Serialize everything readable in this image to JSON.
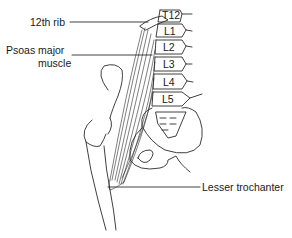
{
  "diagram": {
    "type": "anatomical illustration",
    "labels": {
      "rib": "12th rib",
      "psoas_line1": "Psoas major",
      "psoas_line2": "muscle",
      "lesser_trochanter": "Lesser trochanter"
    },
    "vertebrae": [
      "T12",
      "L1",
      "L2",
      "L3",
      "L4",
      "L5"
    ],
    "colors": {
      "line": "#2a2a2a",
      "background": "#ffffff"
    }
  }
}
